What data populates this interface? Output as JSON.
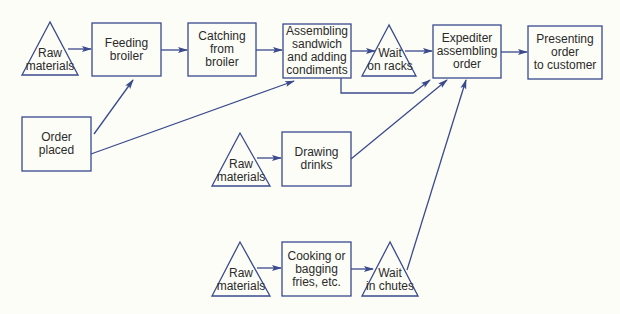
{
  "colors": {
    "stroke": "#3a4a8c",
    "text": "#2a2a2a",
    "background": "#fdfdf8"
  },
  "nodes": {
    "raw_materials_1": {
      "shape": "triangle",
      "label": "Raw\nmaterials"
    },
    "feeding_broiler": {
      "shape": "rect",
      "label": "Feeding\nbroiler"
    },
    "catching_from_broiler": {
      "shape": "rect",
      "label": "Catching\nfrom\nbroiler"
    },
    "assembling_sandwich": {
      "shape": "rect",
      "label": "Assembling\nsandwich\nand adding\ncondiments"
    },
    "wait_on_racks": {
      "shape": "triangle",
      "label": "Wait\non racks"
    },
    "expediter_assembling_order": {
      "shape": "rect",
      "label": "Expediter\nassembling\norder"
    },
    "presenting_order": {
      "shape": "rect",
      "label": "Presenting\norder\nto customer"
    },
    "order_placed": {
      "shape": "rect",
      "label": "Order\nplaced"
    },
    "raw_materials_2": {
      "shape": "triangle",
      "label": "Raw\nmaterials"
    },
    "drawing_drinks": {
      "shape": "rect",
      "label": "Drawing\ndrinks"
    },
    "raw_materials_3": {
      "shape": "triangle",
      "label": "Raw\nmaterials"
    },
    "cooking_fries": {
      "shape": "rect",
      "label": "Cooking or\nbagging\nfries, etc."
    },
    "wait_in_chutes": {
      "shape": "triangle",
      "label": "Wait\nin chutes"
    }
  },
  "edges": [
    {
      "from": "raw_materials_1",
      "to": "feeding_broiler"
    },
    {
      "from": "feeding_broiler",
      "to": "catching_from_broiler"
    },
    {
      "from": "catching_from_broiler",
      "to": "assembling_sandwich"
    },
    {
      "from": "assembling_sandwich",
      "to": "wait_on_racks"
    },
    {
      "from": "wait_on_racks",
      "to": "expediter_assembling_order"
    },
    {
      "from": "assembling_sandwich",
      "to": "expediter_assembling_order",
      "note": "bypass path"
    },
    {
      "from": "expediter_assembling_order",
      "to": "presenting_order"
    },
    {
      "from": "order_placed",
      "to": "feeding_broiler"
    },
    {
      "from": "order_placed",
      "to": "assembling_sandwich"
    },
    {
      "from": "raw_materials_2",
      "to": "drawing_drinks"
    },
    {
      "from": "drawing_drinks",
      "to": "expediter_assembling_order"
    },
    {
      "from": "raw_materials_3",
      "to": "cooking_fries"
    },
    {
      "from": "cooking_fries",
      "to": "wait_in_chutes"
    },
    {
      "from": "wait_in_chutes",
      "to": "expediter_assembling_order"
    }
  ]
}
